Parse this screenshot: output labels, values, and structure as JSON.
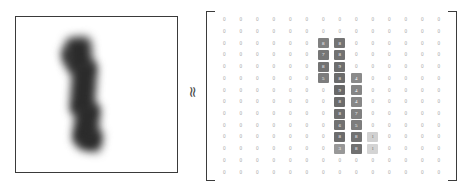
{
  "figure": {
    "relation_symbol": "≈",
    "left_panel": {
      "label": "handwritten-digit-image",
      "digit": "1",
      "appearance": "blurred grayscale handwritten numeral one",
      "ink_color": "#2b2b2b",
      "background_color": "#ffffff",
      "border_color": "#3a3a3a"
    }
  },
  "chart_data": {
    "type": "heatmap",
    "title": "",
    "subtitle": "",
    "xlabel": "",
    "ylabel": "",
    "grid": false,
    "legend": "none",
    "rows": 14,
    "cols": 14,
    "zero_label": "0",
    "zero_color": "#a6a6a6",
    "value_text_color": "#ffffff",
    "colorscale": [
      {
        "stop": 0,
        "hex": "#ffffff"
      },
      {
        "stop": 0.35,
        "hex": "#c9c9c9"
      },
      {
        "stop": 0.6,
        "hex": "#8c8c8c"
      },
      {
        "stop": 1,
        "hex": "#5a5a5a"
      }
    ],
    "values": [
      [
        0,
        0,
        0,
        0,
        0,
        0,
        0,
        0,
        0,
        0,
        0,
        0,
        0,
        0
      ],
      [
        0,
        0,
        0,
        0,
        0,
        0,
        0,
        0,
        0,
        0,
        0,
        0,
        0,
        0
      ],
      [
        0,
        0,
        0,
        0,
        0,
        0,
        0.7,
        0.8,
        0,
        0,
        0,
        0,
        0,
        0
      ],
      [
        0,
        0,
        0,
        0,
        0,
        0,
        0.78,
        0.82,
        0,
        0,
        0,
        0,
        0,
        0
      ],
      [
        0,
        0,
        0,
        0,
        0,
        0,
        0.8,
        0.84,
        0,
        0,
        0,
        0,
        0,
        0
      ],
      [
        0,
        0,
        0,
        0,
        0,
        0,
        0.72,
        0.86,
        0.62,
        0,
        0,
        0,
        0,
        0
      ],
      [
        0,
        0,
        0,
        0,
        0,
        0,
        0,
        0.88,
        0.66,
        0,
        0,
        0,
        0,
        0
      ],
      [
        0,
        0,
        0,
        0,
        0,
        0,
        0,
        0.86,
        0.64,
        0,
        0,
        0,
        0,
        0
      ],
      [
        0,
        0,
        0,
        0,
        0,
        0,
        0,
        0.84,
        0.7,
        0,
        0,
        0,
        0,
        0
      ],
      [
        0,
        0,
        0,
        0,
        0,
        0,
        0,
        0.82,
        0.72,
        0,
        0,
        0,
        0,
        0
      ],
      [
        0,
        0,
        0,
        0,
        0,
        0,
        0,
        0.86,
        0.8,
        0.3,
        0,
        0,
        0,
        0
      ],
      [
        0,
        0,
        0,
        0,
        0,
        0,
        0,
        0.55,
        0.82,
        0.28,
        0,
        0,
        0,
        0
      ],
      [
        0,
        0,
        0,
        0,
        0,
        0,
        0,
        0,
        0,
        0,
        0,
        0,
        0,
        0
      ],
      [
        0,
        0,
        0,
        0,
        0,
        0,
        0,
        0,
        0,
        0,
        0,
        0,
        0,
        0
      ]
    ],
    "cell_labels": [
      [
        "0",
        "0",
        "0",
        "0",
        "0",
        "0",
        "0",
        "0",
        "0",
        "0",
        "0",
        "0",
        "0",
        "0"
      ],
      [
        "0",
        "0",
        "0",
        "0",
        "0",
        "0",
        "0",
        "0",
        "0",
        "0",
        "0",
        "0",
        "0",
        "0"
      ],
      [
        "0",
        "0",
        "0",
        "0",
        "0",
        "0",
        "8",
        "8",
        "0",
        "0",
        "0",
        "0",
        "0",
        "0"
      ],
      [
        "0",
        "0",
        "0",
        "0",
        "0",
        "0",
        "7",
        "8",
        "0",
        "0",
        "0",
        "0",
        "0",
        "0"
      ],
      [
        "0",
        "0",
        "0",
        "0",
        "0",
        "0",
        "8",
        "9",
        "0",
        "0",
        "0",
        "0",
        "0",
        "0"
      ],
      [
        "0",
        "0",
        "0",
        "0",
        "0",
        "0",
        "5",
        "8",
        "4",
        "0",
        "0",
        "0",
        "0",
        "0"
      ],
      [
        "0",
        "0",
        "0",
        "0",
        "0",
        "0",
        "0",
        "9",
        "4",
        "0",
        "0",
        "0",
        "0",
        "0"
      ],
      [
        "0",
        "0",
        "0",
        "0",
        "0",
        "0",
        "0",
        "8",
        "4",
        "0",
        "0",
        "0",
        "0",
        "0"
      ],
      [
        "0",
        "0",
        "0",
        "0",
        "0",
        "0",
        "0",
        "8",
        "7",
        "0",
        "0",
        "0",
        "0",
        "0"
      ],
      [
        "0",
        "0",
        "0",
        "0",
        "0",
        "0",
        "0",
        "6",
        "5",
        "0",
        "0",
        "0",
        "0",
        "0"
      ],
      [
        "0",
        "0",
        "0",
        "0",
        "0",
        "0",
        "0",
        "8",
        "8",
        "1",
        "0",
        "0",
        "0",
        "0"
      ],
      [
        "0",
        "0",
        "0",
        "0",
        "0",
        "0",
        "0",
        "3",
        "8",
        "1",
        "0",
        "0",
        "0",
        "0"
      ],
      [
        "0",
        "0",
        "0",
        "0",
        "0",
        "0",
        "0",
        "0",
        "0",
        "0",
        "0",
        "0",
        "0",
        "0"
      ],
      [
        "0",
        "0",
        "0",
        "0",
        "0",
        "0",
        "0",
        "0",
        "0",
        "0",
        "0",
        "0",
        "0",
        "0"
      ]
    ]
  }
}
